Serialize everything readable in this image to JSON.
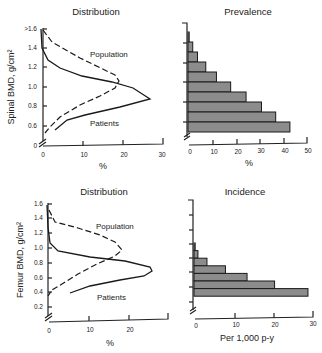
{
  "chart_data": [
    {
      "id": "spinal_distribution",
      "type": "line",
      "title": "Distribution",
      "xlabel": "%",
      "ylabel": "Spinal BMD, g/cm²",
      "xlim": [
        0,
        30
      ],
      "x_ticks": [
        "0",
        "10",
        "20",
        "30"
      ],
      "y_ticks": [
        "0",
        "0.6",
        "0.8",
        "1.0",
        "1.2",
        "1.4",
        ">1.6"
      ],
      "ylim": [
        0.5,
        1.6
      ],
      "series": [
        {
          "name": "Population",
          "style": "dashed",
          "points": [
            [
              0.5,
              1.6
            ],
            [
              2.5,
              1.48
            ],
            [
              9.5,
              1.32
            ],
            [
              18,
              1.15
            ],
            [
              19,
              1.08
            ],
            [
              18,
              1.0
            ],
            [
              14.5,
              0.92
            ],
            [
              9.5,
              0.82
            ],
            [
              4.5,
              0.7
            ],
            [
              2,
              0.6
            ],
            [
              0.5,
              0.54
            ]
          ]
        },
        {
          "name": "Patients",
          "style": "solid",
          "points": [
            [
              0,
              1.6
            ],
            [
              0,
              1.42
            ],
            [
              1.5,
              1.28
            ],
            [
              4.5,
              1.2
            ],
            [
              10,
              1.12
            ],
            [
              17.5,
              1.06
            ],
            [
              22.5,
              1.0
            ],
            [
              26.5,
              0.88
            ],
            [
              19,
              0.8
            ],
            [
              10.5,
              0.72
            ],
            [
              6,
              0.67
            ],
            [
              3,
              0.57
            ]
          ]
        }
      ],
      "annotations": [
        "Population",
        "Patients"
      ]
    },
    {
      "id": "spinal_prevalence",
      "type": "bar",
      "orientation": "horizontal",
      "title": "Prevalence",
      "xlabel": "%",
      "x_ticks": [
        "0",
        "10",
        "20",
        "30",
        "40",
        "50"
      ],
      "xlim": [
        0,
        50
      ],
      "categories": [
        "1.65",
        "1.55",
        "1.45",
        "1.35",
        "1.25",
        "1.15",
        "1.05",
        "0.95",
        "0.85",
        "0.75"
      ],
      "values": [
        0.5,
        2,
        4,
        7.5,
        12,
        18,
        24.5,
        31,
        37,
        43
      ]
    },
    {
      "id": "femur_distribution",
      "type": "line",
      "title": "Distribution",
      "xlabel": "%",
      "ylabel": "Femur BMD, g/cm²",
      "xlim": [
        0,
        30
      ],
      "x_ticks": [
        "0",
        "10",
        "20"
      ],
      "y_ticks": [
        "0.2",
        "0.4",
        "0.6",
        "0.8",
        "1.0",
        "1.2",
        "1.4",
        "1.6"
      ],
      "ylim": [
        0.1,
        1.6
      ],
      "series": [
        {
          "name": "Population",
          "style": "dashed",
          "points": [
            [
              0,
              1.6
            ],
            [
              1.5,
              1.42
            ],
            [
              7,
              1.3
            ],
            [
              12.5,
              1.2
            ],
            [
              16.5,
              1.08
            ],
            [
              18,
              0.96
            ],
            [
              16.5,
              0.88
            ],
            [
              12,
              0.77
            ],
            [
              7,
              0.63
            ],
            [
              3,
              0.5
            ],
            [
              0.5,
              0.42
            ],
            [
              0,
              0.38
            ]
          ]
        },
        {
          "name": "Patients",
          "style": "solid",
          "points": [
            [
              0,
              1.6
            ],
            [
              0,
              1.3
            ],
            [
              0.5,
              1.06
            ],
            [
              2.5,
              0.94
            ],
            [
              10,
              0.86
            ],
            [
              19,
              0.8
            ],
            [
              25,
              0.72
            ],
            [
              25.5,
              0.67
            ],
            [
              23.5,
              0.6
            ],
            [
              17.5,
              0.54
            ],
            [
              10,
              0.46
            ],
            [
              5,
              0.36
            ]
          ]
        }
      ],
      "annotations": [
        "Population",
        "Patients"
      ]
    },
    {
      "id": "femur_incidence",
      "type": "bar",
      "orientation": "horizontal",
      "title": "Incidence",
      "xlabel": "Per 1,000 p-y",
      "x_ticks": [
        "0",
        "10",
        "20",
        "30"
      ],
      "xlim": [
        0,
        30
      ],
      "categories": [
        "0.95",
        "0.85",
        "0.75",
        "0.65",
        "0.55",
        "0.45",
        "0.35"
      ],
      "values": [
        0.3,
        1,
        3.3,
        8,
        13.5,
        20.5,
        29
      ]
    }
  ],
  "labels": {
    "top_left_title": "Distribution",
    "top_right_title": "Prevalence",
    "bottom_left_title": "Distribution",
    "bottom_right_title": "Incidence",
    "spinal_ylabel": "Spinal BMD, g/cm²",
    "femur_ylabel": "Femur BMD, g/cm²",
    "pct": "%",
    "per1000": "Per 1,000 p-y",
    "population": "Population",
    "patients": "Patients"
  }
}
